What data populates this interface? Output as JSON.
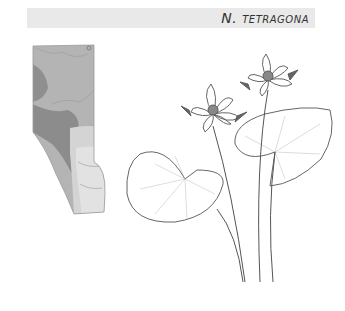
{
  "header": {
    "species_label": "N. tetragona"
  },
  "map": {
    "region": "Alberta",
    "icon": "distribution-map"
  },
  "illustration": {
    "icon": "water-lily-drawing"
  },
  "colors": {
    "banner_bg": "#e9e9e9",
    "title_text": "#333333",
    "map_dark": "#8a8a8a",
    "map_mid": "#a8a8a8",
    "map_light": "#d8d8d8"
  }
}
